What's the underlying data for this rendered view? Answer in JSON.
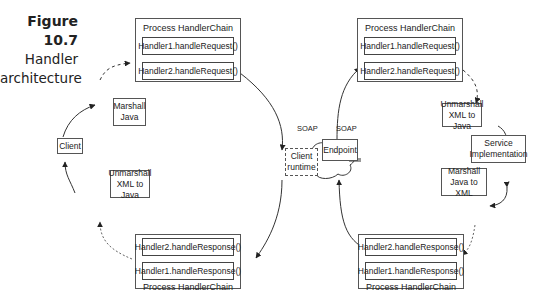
{
  "caption": {
    "number": "Figure 10.7",
    "line1": "Handler",
    "line2": "architecture"
  },
  "client_side": {
    "request_chain": {
      "title": "Process HandlerChain",
      "handlers": [
        "Handler1.handleRequest()",
        "Handler2.handleRequest()"
      ]
    },
    "response_chain": {
      "title": "Process HandlerChain",
      "handlers": [
        "Handler2.handleResponse()",
        "Handler1.handleResponse()"
      ]
    },
    "marshall": "Marshall Java",
    "client": "Client",
    "unmarshall": "Unmarshall XML to Java",
    "runtime": "Client runtime"
  },
  "network": {
    "soap_left": "SOAP",
    "soap_right": "SOAP"
  },
  "server_side": {
    "endpoint": "Endpoint",
    "request_chain": {
      "title": "Process HandlerChain",
      "handlers": [
        "Handler1.handleRequest()",
        "Handler2.handleRequest()"
      ]
    },
    "unmarshall": "Unmarshall XML to Java",
    "service": "Service Implementation",
    "marshall": "Marshall Java to XML",
    "response_chain": {
      "title": "Process HandlerChain",
      "handlers": [
        "Handler2.handleResponse()",
        "Handler1.handleResponse()"
      ]
    }
  }
}
